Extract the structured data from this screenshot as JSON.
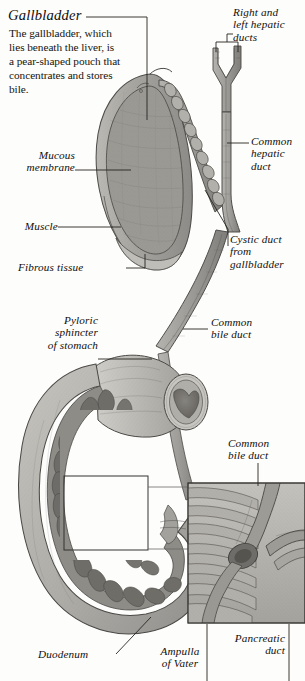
{
  "figure": {
    "title": "Gallbladder",
    "description": "The gallbladder, which lies beneath the liver, is a pear-shaped pouch that concentrates and stores bile.",
    "style": "grayscale-engraving",
    "background_color": "#fdfdfc",
    "ink_color": "#100f0d"
  },
  "labels": {
    "hepatic_ducts": "Right and\nleft hepatic\nducts",
    "common_hepatic_duct": "Common\nhepatic\nduct",
    "cystic_duct": "Cystic duct\nfrom\ngallbladder",
    "mucous_membrane": "Mucous\nmembrane",
    "muscle": "Muscle",
    "fibrous_tissue": "Fibrous tissue",
    "pyloric_sphincter": "Pyloric\nsphincter\nof stomach",
    "common_bile_duct": "Common\nbile duct",
    "common_bile_duct_inset": "Common\nbile duct",
    "duodenum": "Duodenum",
    "ampulla_of_vater": "Ampulla\nof Vater",
    "pancreatic_duct": "Pancreatic\nduct"
  },
  "palette": {
    "tissue_light": "#c9c7c2",
    "tissue_mid": "#a6a49f",
    "tissue_dark": "#7c7a76",
    "lumen_dark": "#6e6c68",
    "mucosa": "#8a8884",
    "outline": "#4a4845",
    "leader": "#2a2926",
    "inset_bg": "#b9b7b2"
  }
}
